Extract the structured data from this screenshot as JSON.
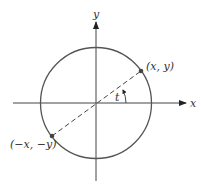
{
  "diagram": {
    "axes": {
      "x_label": "x",
      "y_label": "y"
    },
    "circle": {
      "type": "unit-circle"
    },
    "points": [
      {
        "id": "p1",
        "label": "(x, y)"
      },
      {
        "id": "p2",
        "label": "(−x, −y)"
      }
    ],
    "angle_label": "t",
    "colors": {
      "circle": "#555555",
      "axes": "#333333",
      "point": "#444444"
    }
  }
}
